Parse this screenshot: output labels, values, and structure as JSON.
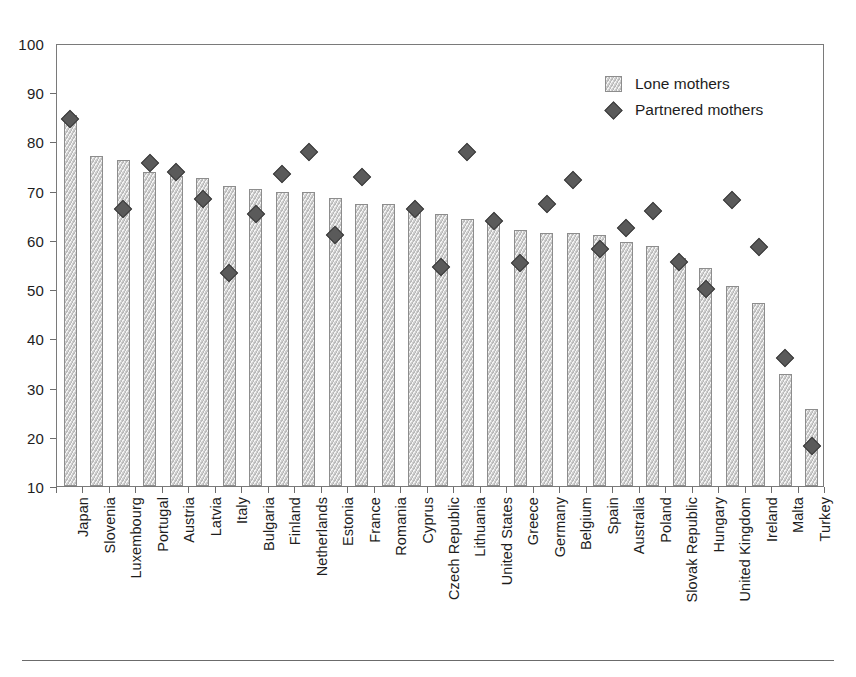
{
  "chart_data": {
    "type": "bar",
    "title": "",
    "subtitle": "",
    "xlabel": "",
    "ylabel": "",
    "ylim": [
      10,
      100
    ],
    "ytick_step": 10,
    "yticks": [
      10,
      20,
      30,
      40,
      50,
      60,
      70,
      80,
      90,
      100
    ],
    "grid": false,
    "legend_position": "top-right",
    "categories": [
      "Japan",
      "Slovenia",
      "Luxembourg",
      "Portugal",
      "Austria",
      "Latvia",
      "Italy",
      "Bulgaria",
      "Finland",
      "Netherlands",
      "Estonia",
      "France",
      "Romania",
      "Cyprus",
      "Czech Republic",
      "Lithuania",
      "United States",
      "Greece",
      "Germany",
      "Belgium",
      "Spain",
      "Australia",
      "Poland",
      "Slovak Republic",
      "Hungary",
      "United Kingdom",
      "Ireland",
      "Malta",
      "Turkey"
    ],
    "series": [
      {
        "name": "Lone mothers",
        "marker": "bar",
        "color": "#cfcfcf",
        "values": [
          85.3,
          77.0,
          76.3,
          73.8,
          73.0,
          72.5,
          71.0,
          70.3,
          69.8,
          69.8,
          68.5,
          67.3,
          67.3,
          66.8,
          65.2,
          64.3,
          64.2,
          62.0,
          61.5,
          61.4,
          60.9,
          59.5,
          58.7,
          56.3,
          54.2,
          50.6,
          47.1,
          32.8,
          25.6
        ]
      },
      {
        "name": "Partnered mothers",
        "marker": "diamond",
        "color": "#5a5a5a",
        "values": [
          85.0,
          null,
          66.6,
          76.0,
          74.3,
          68.7,
          53.6,
          65.6,
          73.8,
          78.2,
          61.5,
          73.1,
          null,
          66.7,
          55.0,
          78.2,
          64.2,
          55.7,
          67.7,
          72.5,
          58.6,
          62.8,
          66.2,
          56.0,
          50.5,
          68.5,
          59.0,
          36.4,
          18.6
        ]
      }
    ]
  },
  "legend": {
    "entries": [
      {
        "label": "Lone mothers",
        "marker": "square"
      },
      {
        "label": "Partnered mothers",
        "marker": "diamond"
      }
    ]
  }
}
